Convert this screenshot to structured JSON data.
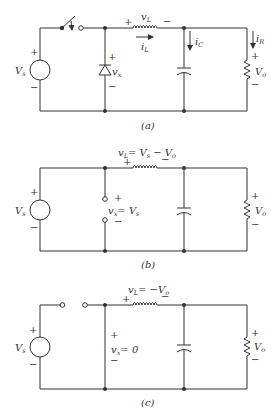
{
  "figure": "Buck converter circuit: (a) circuit, (b) switch closed, (c) switch open",
  "panels": [
    {
      "id": "a",
      "caption": "(a)",
      "labels": {
        "source": "V",
        "source_sub": "s",
        "diode_voltage": "v",
        "diode_voltage_sub": "x",
        "inductor_voltage": "v",
        "inductor_voltage_sub": "L",
        "inductor_current": "i",
        "inductor_current_sub": "L",
        "cap_current": "i",
        "cap_current_sub": "C",
        "res_current": "i",
        "res_current_sub": "R",
        "output": "V",
        "output_sub": "o",
        "plus": "+",
        "minus": "−"
      }
    },
    {
      "id": "b",
      "caption": "(b)",
      "labels": {
        "source": "V",
        "source_sub": "s",
        "vx_eq": "v",
        "vx_eq_sub": "x",
        "vx_eq_rhs": "= V",
        "vx_eq_rhs_sub": "s",
        "vL_eq": "v",
        "vL_eq_sub": "L",
        "vL_eq_rhs": "= V",
        "vL_eq_rhs_sub": "s",
        "vL_eq_rhs2": " − V",
        "vL_eq_rhs2_sub": "o",
        "output": "V",
        "output_sub": "o",
        "plus": "+",
        "minus": "−"
      }
    },
    {
      "id": "c",
      "caption": "(c)",
      "labels": {
        "source": "V",
        "source_sub": "s",
        "vx_eq": "v",
        "vx_eq_sub": "x",
        "vx_eq_rhs": "= 0",
        "vL_eq": "v",
        "vL_eq_sub": "L",
        "vL_eq_rhs": "= −V",
        "vL_eq_rhs_sub": "o",
        "output": "V",
        "output_sub": "o",
        "plus": "+",
        "minus": "−"
      }
    }
  ]
}
